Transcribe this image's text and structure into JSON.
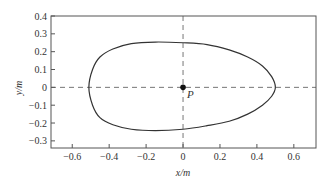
{
  "chart_data": {
    "type": "line",
    "title": "",
    "xlabel": "x/m",
    "ylabel": "y/m",
    "xlim": [
      -0.715,
      0.72
    ],
    "ylim": [
      -0.34,
      0.4
    ],
    "grid": false,
    "legend": null,
    "x_ticks": [
      -0.6,
      -0.4,
      -0.2,
      0,
      0.2,
      0.4,
      0.6
    ],
    "x_tick_labels": [
      "−0.6",
      "−0.4",
      "−0.2",
      "0",
      "0.2",
      "0.4",
      "0.6"
    ],
    "y_ticks": [
      0.4,
      0.3,
      0.2,
      0.1,
      0,
      -0.1,
      -0.2,
      -0.3
    ],
    "y_tick_labels": [
      "0.4",
      "0.3",
      "0.2",
      "0.1",
      "0",
      "−0.1",
      "−0.2",
      "−0.3"
    ],
    "reference_lines": [
      {
        "orientation": "horizontal",
        "value": 0,
        "style": "dashed"
      },
      {
        "orientation": "vertical",
        "value": 0,
        "style": "dashed"
      }
    ],
    "series": [
      {
        "name": "closed-curve",
        "closed": true,
        "x": [
          0.5,
          0.48,
          0.43,
          0.35,
          0.25,
          0.13,
          0.0,
          -0.15,
          -0.28,
          -0.38,
          -0.45,
          -0.49,
          -0.51,
          -0.49,
          -0.45,
          -0.38,
          -0.28,
          -0.15,
          0.0,
          0.13,
          0.25,
          0.35,
          0.43,
          0.48,
          0.5
        ],
        "y": [
          0.0,
          0.06,
          0.12,
          0.17,
          0.21,
          0.24,
          0.25,
          0.254,
          0.245,
          0.215,
          0.17,
          0.1,
          0.0,
          -0.1,
          -0.17,
          -0.21,
          -0.235,
          -0.243,
          -0.235,
          -0.215,
          -0.19,
          -0.15,
          -0.1,
          -0.05,
          0.0
        ]
      }
    ],
    "annotations": [
      {
        "text": "P",
        "x": 0,
        "y": 0,
        "marker": "filled-circle"
      }
    ]
  }
}
